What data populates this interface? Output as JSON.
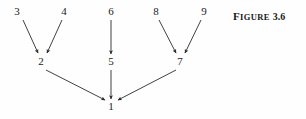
{
  "figure": {
    "caption_full": "FIGURE 3.6",
    "caption_word_first": "F",
    "caption_word_rest": "IGURE",
    "caption_number": "3.6"
  },
  "graph": {
    "type": "directed-graph",
    "description": "Precedence / dependency diagram with nine numbered nodes and directed arrows converging on node 1",
    "nodes": [
      {
        "id": "1",
        "label": "1",
        "x": 111,
        "y": 107
      },
      {
        "id": "2",
        "label": "2",
        "x": 41,
        "y": 62
      },
      {
        "id": "3",
        "label": "3",
        "x": 17,
        "y": 12
      },
      {
        "id": "4",
        "label": "4",
        "x": 64,
        "y": 12
      },
      {
        "id": "5",
        "label": "5",
        "x": 111,
        "y": 62
      },
      {
        "id": "6",
        "label": "6",
        "x": 111,
        "y": 12
      },
      {
        "id": "7",
        "label": "7",
        "x": 180,
        "y": 62
      },
      {
        "id": "8",
        "label": "8",
        "x": 156,
        "y": 12
      },
      {
        "id": "9",
        "label": "9",
        "x": 204,
        "y": 12
      }
    ],
    "edges": [
      {
        "from": "3",
        "to": "2",
        "x1": 23,
        "y1": 20,
        "x2": 38,
        "y2": 53
      },
      {
        "from": "4",
        "to": "2",
        "x1": 62,
        "y1": 20,
        "x2": 47,
        "y2": 53
      },
      {
        "from": "6",
        "to": "5",
        "x1": 111,
        "y1": 20,
        "x2": 111,
        "y2": 54
      },
      {
        "from": "8",
        "to": "7",
        "x1": 159,
        "y1": 20,
        "x2": 176,
        "y2": 53
      },
      {
        "from": "9",
        "to": "7",
        "x1": 201,
        "y1": 20,
        "x2": 185,
        "y2": 53
      },
      {
        "from": "2",
        "to": "1",
        "x1": 46,
        "y1": 70,
        "x2": 105,
        "y2": 100
      },
      {
        "from": "5",
        "to": "1",
        "x1": 111,
        "y1": 70,
        "x2": 111,
        "y2": 99
      },
      {
        "from": "7",
        "to": "1",
        "x1": 176,
        "y1": 70,
        "x2": 118,
        "y2": 100
      }
    ],
    "stroke_color": "#2b2b2b",
    "label_color": "#1a1a1a",
    "background_color": "#fefefe"
  }
}
